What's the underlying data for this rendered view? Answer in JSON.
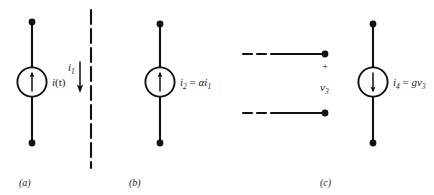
{
  "figure": {
    "background": "#ffffff",
    "ink": "#111111"
  },
  "circuits": [
    {
      "id": "independent-current-source",
      "caption": "(a)",
      "label": "i(t)",
      "label_main": "i",
      "label_paren": "(t)",
      "arrow_direction": "up",
      "symbol": "circle-current-source"
    },
    {
      "id": "controlling-branch",
      "caption": "",
      "label_main": "i",
      "label_sub": "1",
      "arrow_direction": "down",
      "symbol": "dashed-vertical-branch"
    },
    {
      "id": "current-controlled-current-source",
      "caption": "(b)",
      "label_main": "i",
      "label_sub": "2",
      "equals": "=",
      "expr_coeff": "α",
      "expr_var": "i",
      "expr_var_sub": "1",
      "arrow_direction": "up",
      "symbol": "circle-current-source"
    },
    {
      "id": "voltage-port",
      "caption": "(c)",
      "polarity_plus": "+",
      "label_main": "v",
      "label_sub": "3",
      "symbol": "open-port-dashed-leads"
    },
    {
      "id": "voltage-controlled-current-source",
      "caption": "",
      "label_main": "i",
      "label_sub": "4",
      "equals": "=",
      "expr_coeff": "g",
      "expr_var": "v",
      "expr_var_sub": "3",
      "arrow_direction": "down",
      "symbol": "circle-current-source"
    }
  ]
}
